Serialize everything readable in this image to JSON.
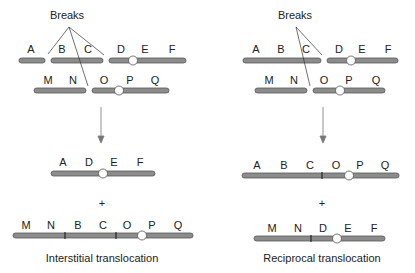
{
  "left_panel": {
    "breaks_label": "Breaks",
    "top_chr1": [
      "A",
      "B",
      "C",
      "D",
      "E",
      "F"
    ],
    "top_chr2": [
      "M",
      "N",
      "O",
      "P",
      "Q"
    ],
    "result1": [
      "A",
      "D",
      "E",
      "F"
    ],
    "plus": "+",
    "result2": [
      "M",
      "N",
      "B",
      "C",
      "O",
      "P",
      "Q"
    ],
    "caption": "Interstitial translocation"
  },
  "right_panel": {
    "breaks_label": "Breaks",
    "top_chr1": [
      "A",
      "B",
      "C",
      "D",
      "E",
      "F"
    ],
    "top_chr2": [
      "M",
      "N",
      "O",
      "P",
      "Q"
    ],
    "result1": [
      "A",
      "B",
      "C",
      "O",
      "P",
      "Q"
    ],
    "plus": "+",
    "result2": [
      "M",
      "N",
      "D",
      "E",
      "F"
    ],
    "caption": "Reciprocal translocation"
  },
  "colors": {
    "chromosome": "#8a8a8a",
    "outline": "#555555",
    "centromere": "#ffffff"
  }
}
